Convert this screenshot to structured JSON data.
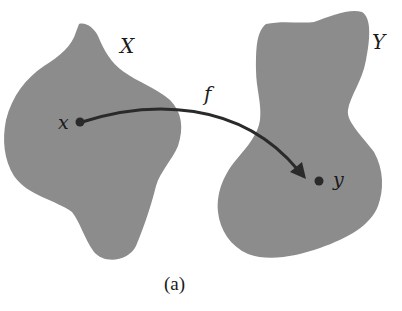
{
  "diagram": {
    "type": "function-mapping",
    "caption": "(a)",
    "sets": [
      {
        "id": "X",
        "label": "X",
        "fill": "#8c8c8c"
      },
      {
        "id": "Y",
        "label": "Y",
        "fill": "#8c8c8c"
      }
    ],
    "points": [
      {
        "id": "x",
        "label": "x",
        "set": "X"
      },
      {
        "id": "y",
        "label": "y",
        "set": "Y"
      }
    ],
    "arrow": {
      "from": "x",
      "to": "y",
      "label": "f",
      "color": "#2a2a2a"
    }
  }
}
